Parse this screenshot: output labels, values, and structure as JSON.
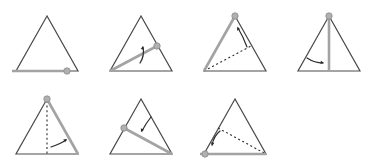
{
  "figure": {
    "type": "diagram-sequence",
    "canvas": {
      "width": 376,
      "height": 166,
      "background": "#ffffff"
    },
    "grid": {
      "columns": 4,
      "rows": 2,
      "panel_width": 94,
      "panel_height": 83,
      "filled_cells": 7,
      "empty_cells": 1
    },
    "colors": {
      "triangle_stroke": "#4a4a4a",
      "segment": "#a3a3a3",
      "marker_fill": "#b0b0b0",
      "marker_stroke": "#8a8a8a",
      "dotted": "#2b2b2b",
      "arrow": "#2b2b2b",
      "background": "#ffffff"
    },
    "geometry": {
      "triangle_apex": {
        "x": 47,
        "y": 16
      },
      "triangle_left": {
        "x": 16,
        "y": 71
      },
      "triangle_right": {
        "x": 78,
        "y": 71
      },
      "stroke_width_triangle": 1.2,
      "stroke_width_segment": 2.6,
      "marker_radius": 3.2,
      "dash_pattern": "2,2.6"
    },
    "panels": [
      {
        "index": 1,
        "name": "panel-step-1",
        "label": "Step 1",
        "description": "Segment lies flat along the base; marker near the right vertex.",
        "segment": {
          "from": "base-left",
          "to": "base-right-inner",
          "x1": 12,
          "y1": 71,
          "x2": 67,
          "y2": 71
        },
        "marker": {
          "x": 67,
          "y": 71
        },
        "dotted_line": null,
        "arrow": null
      },
      {
        "index": 2,
        "name": "panel-step-2",
        "label": "Step 2",
        "description": "Segment pivots from the bottom-left vertex up to the right edge; arrow shows upward rotation.",
        "segment": {
          "from": "bottom-left-vertex",
          "to": "right-edge-mid",
          "x1": 16,
          "y1": 71,
          "x2": 63,
          "y2": 46
        },
        "marker": {
          "x": 63,
          "y": 46
        },
        "dotted_line": null,
        "arrow": {
          "path": "M 46,63 C 50,57 50,52 49,47",
          "head": "up",
          "hx": 49,
          "hy": 46,
          "angle": -80
        }
      },
      {
        "index": 3,
        "name": "panel-step-3",
        "label": "Step 3",
        "description": "Segment now lies along the left edge to the apex; the previous position is shown dotted.",
        "segment": {
          "from": "bottom-left-vertex",
          "to": "apex",
          "x1": 16,
          "y1": 71,
          "x2": 47,
          "y2": 16
        },
        "marker": {
          "x": 47,
          "y": 16
        },
        "dotted_line": {
          "x1": 16,
          "y1": 71,
          "x2": 63,
          "y2": 46
        },
        "arrow": {
          "path": "M 59,47 C 56,39 53,33 50,28",
          "head": "up-left",
          "hx": 49,
          "hy": 27,
          "angle": -120
        }
      },
      {
        "index": 4,
        "name": "panel-step-4",
        "label": "Step 4",
        "description": "Segment hangs vertically from the apex down to the base; arrow shows rightward sweep.",
        "segment": {
          "from": "apex",
          "to": "base-midpoint",
          "x1": 47,
          "y1": 16,
          "x2": 47,
          "y2": 71
        },
        "marker": {
          "x": 47,
          "y": 16
        },
        "dotted_line": null,
        "arrow": {
          "path": "M 25,58 C 31,62 36,63 41,63",
          "head": "right",
          "hx": 42,
          "hy": 63,
          "angle": 10
        }
      },
      {
        "index": 5,
        "name": "panel-step-5",
        "label": "Step 5",
        "description": "Segment lies along the right edge and the base; the vertical position is shown dotted.",
        "segment": {
          "from": "apex",
          "to": "bottom-right-vertex",
          "x1": 47,
          "y1": 16,
          "x2": 78,
          "y2": 71
        },
        "marker": {
          "x": 47,
          "y": 16
        },
        "dotted_line": {
          "x1": 47,
          "y1": 18,
          "x2": 47,
          "y2": 71
        },
        "arrow": {
          "path": "M 51,64 C 57,62 62,60 66,57",
          "head": "up-right",
          "hx": 67,
          "hy": 56,
          "angle": -35
        }
      },
      {
        "index": 6,
        "name": "panel-step-6",
        "label": "Step 6",
        "description": "Segment runs from a marker on the left edge down to the bottom-right vertex.",
        "segment": {
          "from": "left-edge-mid",
          "to": "bottom-right-vertex",
          "x1": 30,
          "y1": 45,
          "x2": 78,
          "y2": 71
        },
        "marker": {
          "x": 30,
          "y": 45
        },
        "dotted_line": null,
        "arrow": {
          "path": "M 57,34 C 53,39 50,44 48,48",
          "head": "down-left",
          "hx": 47,
          "hy": 49,
          "angle": 115
        }
      },
      {
        "index": 7,
        "name": "panel-step-7",
        "label": "Step 7",
        "description": "Segment returns to the base with the marker at the left; the previous diagonal is dotted.",
        "segment": {
          "from": "base-left-outer",
          "to": "bottom-right-vertex",
          "x1": 12,
          "y1": 71,
          "x2": 78,
          "y2": 71
        },
        "marker": {
          "x": 17,
          "y": 71
        },
        "dotted_line": {
          "x1": 30,
          "y1": 45,
          "x2": 78,
          "y2": 71
        },
        "arrow": {
          "path": "M 32,48 C 27,52 25,57 24,62",
          "head": "down",
          "hx": 24,
          "hy": 63,
          "angle": 100
        }
      }
    ]
  }
}
